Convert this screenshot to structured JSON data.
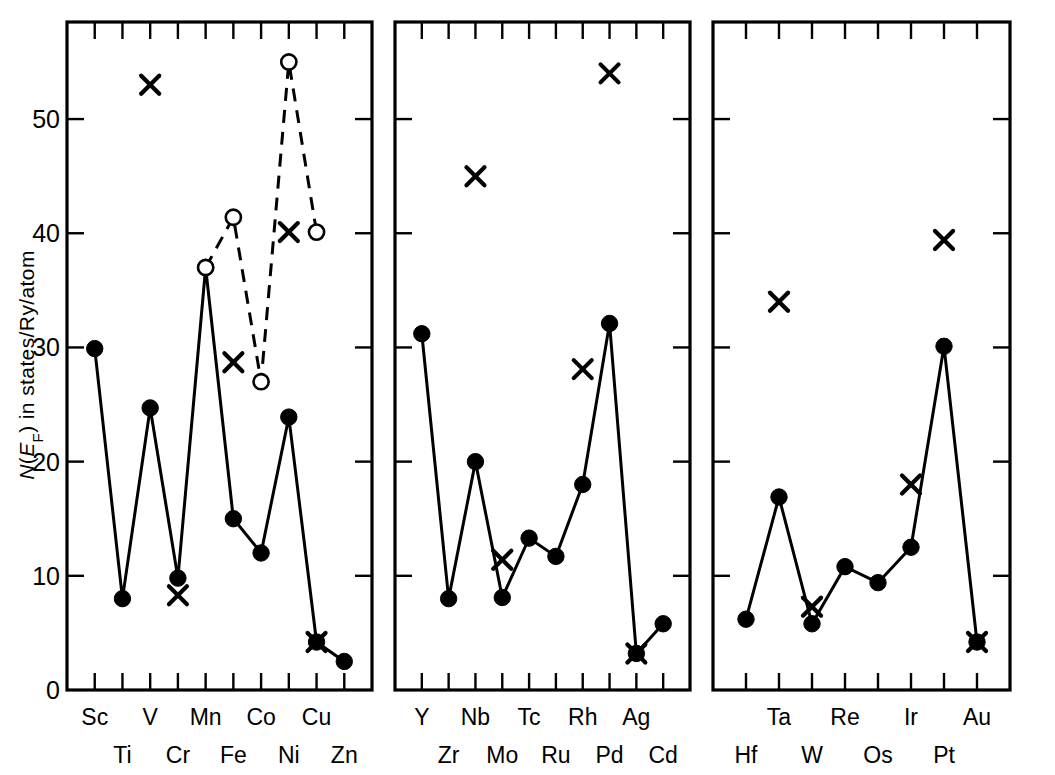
{
  "axis": {
    "ylabel_parts": {
      "n": "N",
      "paren_open": "(",
      "e": "E",
      "sub": "F",
      "paren_close": ")",
      "rest": " in states/Ry/atom"
    },
    "ylabel_full": "N(EF) in states/Ry/atom",
    "ytick_labels": [
      "0",
      "10",
      "20",
      "30",
      "40",
      "50"
    ],
    "ytick_values": [
      0,
      10,
      20,
      30,
      40,
      50
    ],
    "ymin": 0,
    "ymax": 58.5
  },
  "colors": {
    "ink": "#000000",
    "background": "#ffffff"
  },
  "chart_data": {
    "type": "line",
    "title": "",
    "xlabel": "",
    "ylabel": "N(E_F) in states/Ry/atom",
    "ylim": [
      0,
      58.5
    ],
    "grid": false,
    "legend_position": "none",
    "panels": [
      {
        "name": "3d-transition-metals",
        "categories": [
          "Sc",
          "Ti",
          "V",
          "Cr",
          "Mn",
          "Fe",
          "Co",
          "Ni",
          "Cu",
          "Zn"
        ],
        "top_row_labels": [
          "Sc",
          "",
          "V",
          "",
          "Mn",
          "",
          "Co",
          "",
          "Cu",
          ""
        ],
        "bottom_row_labels": [
          "",
          "Ti",
          "",
          "Cr",
          "",
          "Fe",
          "",
          "Ni",
          "",
          "Zn"
        ],
        "series": [
          {
            "name": "filled-circle-solid-line",
            "marker": "filled-circle",
            "line": "solid",
            "x": [
              "Sc",
              "Ti",
              "V",
              "Cr",
              "Mn",
              "Fe",
              "Co",
              "Ni",
              "Cu",
              "Zn"
            ],
            "values": [
              29.9,
              8.0,
              24.7,
              9.8,
              37.0,
              15.0,
              12.0,
              23.9,
              4.2,
              2.5
            ]
          },
          {
            "name": "open-circle-dashed-line",
            "marker": "open-circle",
            "line": "dashed",
            "x": [
              "Mn",
              "Fe",
              "Co",
              "Ni",
              "Cu"
            ],
            "values": [
              37.0,
              41.4,
              27.0,
              55.0,
              40.1
            ]
          },
          {
            "name": "cross-markers",
            "marker": "cross",
            "line": "none",
            "x": [
              "V",
              "Cr",
              "Fe",
              "Ni",
              "Cu"
            ],
            "values": [
              53.0,
              8.3,
              28.7,
              40.1,
              4.2
            ]
          }
        ]
      },
      {
        "name": "4d-transition-metals",
        "categories": [
          "Y",
          "Zr",
          "Nb",
          "Mo",
          "Tc",
          "Ru",
          "Rh",
          "Pd",
          "Ag",
          "Cd"
        ],
        "top_row_labels": [
          "Y",
          "",
          "Nb",
          "",
          "Tc",
          "",
          "Rh",
          "",
          "Ag",
          ""
        ],
        "bottom_row_labels": [
          "",
          "Zr",
          "",
          "Mo",
          "",
          "Ru",
          "",
          "Pd",
          "",
          "Cd"
        ],
        "series": [
          {
            "name": "filled-circle-solid-line",
            "marker": "filled-circle",
            "line": "solid",
            "x": [
              "Y",
              "Zr",
              "Nb",
              "Mo",
              "Tc",
              "Ru",
              "Rh",
              "Pd",
              "Ag",
              "Cd"
            ],
            "values": [
              31.2,
              8.0,
              20.0,
              8.1,
              13.3,
              11.7,
              18.0,
              32.1,
              3.2,
              5.8
            ]
          },
          {
            "name": "cross-markers",
            "marker": "cross",
            "line": "none",
            "x": [
              "Nb",
              "Mo",
              "Rh",
              "Pd",
              "Ag"
            ],
            "values": [
              45.0,
              11.4,
              28.1,
              54.0,
              3.2
            ]
          }
        ]
      },
      {
        "name": "5d-transition-metals",
        "categories": [
          "Hf",
          "Ta",
          "W",
          "Re",
          "Os",
          "Ir",
          "Pt",
          "Au"
        ],
        "top_row_labels": [
          "",
          "Ta",
          "",
          "Re",
          "",
          "Ir",
          "",
          "Au"
        ],
        "bottom_row_labels": [
          "Hf",
          "",
          "W",
          "",
          "Os",
          "",
          "Pt",
          ""
        ],
        "series": [
          {
            "name": "filled-circle-solid-line",
            "marker": "filled-circle",
            "line": "solid",
            "x": [
              "Hf",
              "Ta",
              "W",
              "Re",
              "Os",
              "Ir",
              "Pt",
              "Au"
            ],
            "values": [
              6.2,
              16.9,
              5.8,
              10.8,
              9.4,
              12.5,
              30.1,
              4.2
            ]
          },
          {
            "name": "cross-markers",
            "marker": "cross",
            "line": "none",
            "x": [
              "Ta",
              "W",
              "Ir",
              "Pt",
              "Au"
            ],
            "values": [
              34.0,
              7.3,
              18.0,
              39.4,
              4.2
            ]
          }
        ]
      }
    ]
  }
}
